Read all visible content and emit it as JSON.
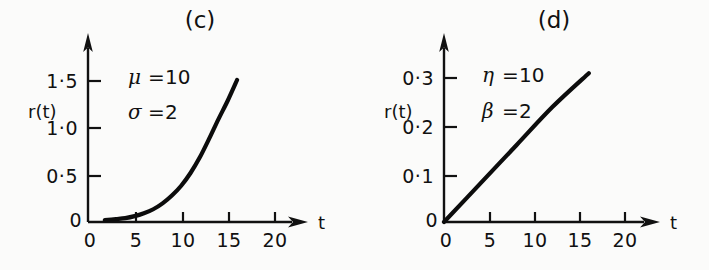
{
  "figure": {
    "background_color": "#fbfbfa",
    "ink_color": "#111111"
  },
  "panels": [
    {
      "tag": "(c)",
      "ylabel": "r(t)",
      "xlabel": "t",
      "params": [
        {
          "symbol": "μ",
          "eq": "=",
          "value": "10"
        },
        {
          "symbol": "σ",
          "eq": "=",
          "value": "2"
        }
      ],
      "yticks": [
        "1·5",
        "1·0",
        "0·5"
      ],
      "yzero": "0",
      "xticks": [
        "0",
        "5",
        "10",
        "15",
        "20"
      ]
    },
    {
      "tag": "(d)",
      "ylabel": "r(t)",
      "xlabel": "t",
      "params": [
        {
          "symbol": "η",
          "eq": "=",
          "value": "10"
        },
        {
          "symbol": "β",
          "eq": "=",
          "value": "2"
        }
      ],
      "yticks": [
        "0·3",
        "0·2",
        "0·1"
      ],
      "yzero": "0",
      "xticks": [
        "0",
        "5",
        "10",
        "15",
        "20"
      ]
    }
  ],
  "chart_data": [
    {
      "type": "line",
      "title": "(c)",
      "xlabel": "t",
      "ylabel": "r(t)",
      "xlim": [
        0,
        22
      ],
      "ylim": [
        0,
        1.6
      ],
      "xticks": [
        0,
        5,
        10,
        15,
        20
      ],
      "ytick_values": [
        0.5,
        1.0,
        1.5
      ],
      "ytick_labels": [
        "0·5",
        "1·0",
        "1·5"
      ],
      "grid": false,
      "legend": "none",
      "annotations": [
        "μ = 10",
        "σ = 2"
      ],
      "series": [
        {
          "name": "r(t) lognormal hazard",
          "x": [
            1.8,
            3,
            4,
            5,
            6,
            7,
            8,
            9,
            10,
            11,
            12,
            13,
            14,
            15,
            16
          ],
          "y": [
            0.02,
            0.03,
            0.04,
            0.06,
            0.09,
            0.13,
            0.19,
            0.27,
            0.37,
            0.5,
            0.66,
            0.85,
            1.05,
            1.24,
            1.45
          ]
        }
      ]
    },
    {
      "type": "line",
      "title": "(d)",
      "xlabel": "t",
      "ylabel": "r(t)",
      "xlim": [
        0,
        22
      ],
      "ylim": [
        0,
        0.34
      ],
      "xticks": [
        0,
        5,
        10,
        15,
        20
      ],
      "ytick_values": [
        0.1,
        0.2,
        0.3
      ],
      "ytick_labels": [
        "0·1",
        "0·2",
        "0·3"
      ],
      "grid": false,
      "legend": "none",
      "annotations": [
        "η = 10",
        "β = 2"
      ],
      "series": [
        {
          "name": "r(t) Weibull hazard",
          "x": [
            0,
            4,
            8,
            12,
            16
          ],
          "y": [
            0.0,
            0.08,
            0.16,
            0.24,
            0.31
          ]
        }
      ]
    }
  ]
}
